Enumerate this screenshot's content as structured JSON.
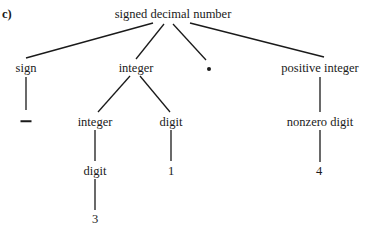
{
  "figure": {
    "panel_label": "c)"
  },
  "tree": {
    "root": {
      "label": "signed decimal number",
      "x": 173,
      "y": 14
    },
    "level1": {
      "sign": {
        "label": "sign",
        "x": 26,
        "y": 68
      },
      "integer": {
        "label": "integer",
        "x": 136,
        "y": 68
      },
      "point": {
        "label": "•",
        "symbol": "decimal-point",
        "x": 209,
        "y": 69
      },
      "positive_integer": {
        "label": "positive integer",
        "x": 320,
        "y": 68
      }
    },
    "level2": {
      "minus": {
        "label": "—",
        "symbol": "minus-sign",
        "x": 26,
        "y": 121
      },
      "integer": {
        "label": "integer",
        "x": 95,
        "y": 122
      },
      "digit": {
        "label": "digit",
        "x": 171,
        "y": 122
      },
      "nonzero_digit": {
        "label": "nonzero digit",
        "x": 320,
        "y": 122
      }
    },
    "level3": {
      "digit": {
        "label": "digit",
        "x": 95,
        "y": 171
      },
      "one": {
        "label": "1",
        "x": 171,
        "y": 171
      },
      "four": {
        "label": "4",
        "x": 319,
        "y": 171
      }
    },
    "level4": {
      "three": {
        "label": "3",
        "x": 95,
        "y": 219
      }
    },
    "edges": [
      {
        "from": "signed decimal number",
        "to": "sign",
        "x1": 153,
        "y1": 23,
        "x2": 26,
        "y2": 58
      },
      {
        "from": "signed decimal number",
        "to": "integer",
        "x1": 164,
        "y1": 24,
        "x2": 136,
        "y2": 59
      },
      {
        "from": "signed decimal number",
        "to": "•",
        "x1": 173,
        "y1": 24,
        "x2": 206,
        "y2": 60
      },
      {
        "from": "signed decimal number",
        "to": "positive integer",
        "x1": 190,
        "y1": 23,
        "x2": 324,
        "y2": 57
      },
      {
        "from": "sign",
        "to": "—",
        "x1": 26,
        "y1": 77,
        "x2": 26,
        "y2": 110
      },
      {
        "from": "integer",
        "to": "integer",
        "x1": 130,
        "y1": 76,
        "x2": 98,
        "y2": 112
      },
      {
        "from": "integer",
        "to": "digit",
        "x1": 140,
        "y1": 76,
        "x2": 170,
        "y2": 112
      },
      {
        "from": "positive integer",
        "to": "nonzero digit",
        "x1": 320,
        "y1": 77,
        "x2": 320,
        "y2": 112
      },
      {
        "from": "integer",
        "to": "digit",
        "x1": 95,
        "y1": 130,
        "x2": 95,
        "y2": 161
      },
      {
        "from": "digit",
        "to": "1",
        "x1": 171,
        "y1": 130,
        "x2": 171,
        "y2": 161
      },
      {
        "from": "nonzero digit",
        "to": "4",
        "x1": 320,
        "y1": 130,
        "x2": 320,
        "y2": 162
      },
      {
        "from": "digit",
        "to": "3",
        "x1": 95,
        "y1": 179,
        "x2": 95,
        "y2": 210
      }
    ]
  },
  "colors": {
    "background": "#ffffff",
    "ink": "#1a1a1a"
  }
}
